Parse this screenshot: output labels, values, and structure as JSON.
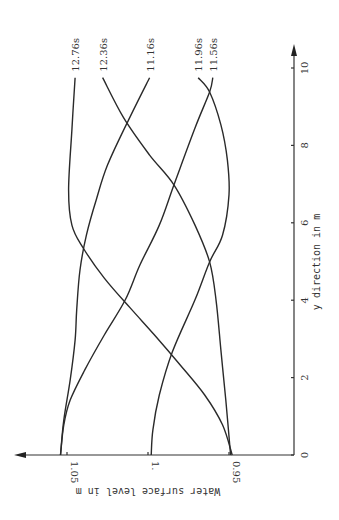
{
  "chart_data": {
    "type": "line",
    "orientation": "rotated 90° clockwise (y-direction runs bottom-to-top on the page, water surface level runs right-to-left)",
    "title": "",
    "xlabel": "y direction in m",
    "ylabel": "Water surface level in m",
    "x_ticks": [
      "0",
      "2",
      "4",
      "6",
      "8",
      "10"
    ],
    "x_tick_values": [
      0,
      2,
      4,
      6,
      8,
      10
    ],
    "y_ticks": [
      "0.95",
      "1.",
      "1.05"
    ],
    "y_tick_values": [
      0.95,
      1.0,
      1.05
    ],
    "xlim": [
      0,
      10.5
    ],
    "ylim": [
      0.94,
      1.06
    ],
    "grid": false,
    "legend": "inline labels at curve ends",
    "series": [
      {
        "name": "12.76s",
        "x": [
          9.75,
          8.4,
          6.85,
          5.94,
          5.35,
          4.57,
          3.8,
          3.1,
          2.32,
          1.55,
          0.78,
          0.0
        ],
        "y": [
          1.045,
          1.047,
          1.049,
          1.047,
          1.04,
          1.027,
          1.011,
          0.996,
          0.98,
          0.965,
          0.954,
          0.948
        ]
      },
      {
        "name": "12.36s",
        "x": [
          9.75,
          8.71,
          7.75,
          6.98,
          5.94,
          4.99,
          4.01,
          2.71,
          1.42,
          0.0
        ],
        "y": [
          1.028,
          1.015,
          0.999,
          0.984,
          0.971,
          0.962,
          0.958,
          0.955,
          0.952,
          0.949
        ]
      },
      {
        "name": "11.16s",
        "x": [
          9.75,
          8.66,
          7.49,
          6.59,
          5.68,
          4.78,
          3.75,
          2.97,
          1.94,
          0.9,
          0.0
        ],
        "y": [
          0.999,
          1.012,
          1.025,
          1.032,
          1.038,
          1.042,
          1.044,
          1.045,
          1.048,
          1.052,
          1.054
        ]
      },
      {
        "name": "11.96s",
        "x": [
          9.75,
          9.38,
          8.53,
          7.62,
          6.72,
          5.68,
          4.99,
          4.01,
          2.66,
          1.55,
          0.65,
          0.0
        ],
        "y": [
          0.969,
          0.962,
          0.955,
          0.951,
          0.95,
          0.954,
          0.962,
          0.971,
          0.985,
          0.993,
          0.997,
          0.998
        ]
      },
      {
        "name": "11.56s",
        "x": [
          9.75,
          9.38,
          8.45,
          6.98,
          5.94,
          4.91,
          4.01,
          3.1,
          2.2,
          1.42,
          0.78,
          0.0
        ],
        "y": [
          0.96,
          0.962,
          0.971,
          0.984,
          0.993,
          1.005,
          1.014,
          1.027,
          1.039,
          1.048,
          1.052,
          1.054
        ]
      }
    ]
  },
  "labels": {
    "x_axis_title": "y direction in m",
    "y_axis_title": "Water surface level in m"
  }
}
